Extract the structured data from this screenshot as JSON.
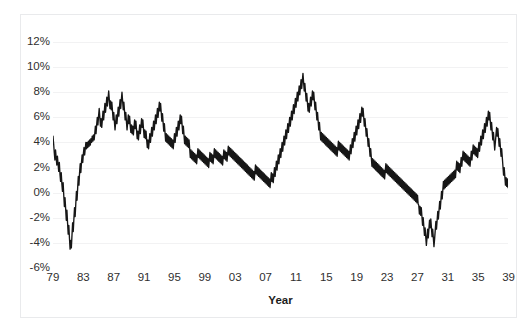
{
  "chart_data": {
    "type": "line",
    "title": "",
    "xlabel": "Year",
    "ylabel": "",
    "grid": true,
    "legend": false,
    "xlim": [
      1979,
      1948
    ],
    "ylim": [
      -6,
      12
    ],
    "ytick_labels": [
      "12%",
      "10%",
      "8%",
      "6%",
      "4%",
      "2%",
      "0%",
      "-2%",
      "-4%",
      "-6%"
    ],
    "ytick_values": [
      12,
      10,
      8,
      6,
      4,
      2,
      0,
      -2,
      -4,
      -6
    ],
    "xtick_labels": [
      "79",
      "83",
      "87",
      "91",
      "95",
      "99",
      "03",
      "07",
      "11",
      "15",
      "19",
      "23",
      "27",
      "31",
      "35",
      "39",
      "43",
      "47"
    ],
    "xtick_values": [
      1979,
      1983,
      1987,
      1991,
      1995,
      1999,
      2003,
      2007,
      2011,
      2015,
      2019,
      2023,
      2027,
      2031,
      2035,
      2039,
      2043,
      2047
    ],
    "series": [
      {
        "name": "rate",
        "color": "#161616",
        "x_start": 1979.0,
        "x_step": 0.0833333,
        "values": [
          4.5,
          3.9,
          3.2,
          2.6,
          3.4,
          2.8,
          2.2,
          2.9,
          2.3,
          1.7,
          2.4,
          1.5,
          0.9,
          1.6,
          0.7,
          0.1,
          0.8,
          -0.2,
          -1.1,
          -0.4,
          -1.3,
          -2.2,
          -1.4,
          -2.4,
          -3.3,
          -2.6,
          -3.6,
          -4.5,
          -3.8,
          -4.4,
          -3.4,
          -2.4,
          -3.1,
          -2.1,
          -1.2,
          -1.9,
          -0.9,
          0.1,
          -0.6,
          0.4,
          1.3,
          0.6,
          1.6,
          2.3,
          1.6,
          2.4,
          3.0,
          2.4,
          3.1,
          3.6,
          3.0,
          3.5,
          4.0,
          3.5,
          4.0,
          3.6,
          4.1,
          3.7,
          4.2,
          3.8,
          4.3,
          4.0,
          4.5,
          4.1,
          4.6,
          4.2,
          4.7,
          5.3,
          4.7,
          5.4,
          6.0,
          5.4,
          6.1,
          6.7,
          6.0,
          5.3,
          5.9,
          5.2,
          5.8,
          6.5,
          5.8,
          6.4,
          7.1,
          6.4,
          7.0,
          7.6,
          6.9,
          7.5,
          8.1,
          7.4,
          6.7,
          7.3,
          6.6,
          7.2,
          6.5,
          5.8,
          6.4,
          5.7,
          5.0,
          5.6,
          6.2,
          5.5,
          6.1,
          6.8,
          6.1,
          6.8,
          7.4,
          6.7,
          7.4,
          8.0,
          7.3,
          6.6,
          7.2,
          6.5,
          5.8,
          6.4,
          5.7,
          5.0,
          5.6,
          6.2,
          5.5,
          6.1,
          5.4,
          4.8,
          5.4,
          4.7,
          5.3,
          4.6,
          5.2,
          5.8,
          5.1,
          5.7,
          5.0,
          4.3,
          4.9,
          4.2,
          4.8,
          5.4,
          4.7,
          5.3,
          5.9,
          5.2,
          5.8,
          5.1,
          4.4,
          5.0,
          4.3,
          4.9,
          4.2,
          3.6,
          4.2,
          3.5,
          4.1,
          4.7,
          4.0,
          4.6,
          5.2,
          4.5,
          5.1,
          5.7,
          5.0,
          5.6,
          6.2,
          5.5,
          6.1,
          6.7,
          6.0,
          6.6,
          7.2,
          6.5,
          7.1,
          6.4,
          5.7,
          6.3,
          5.6,
          4.9,
          5.5,
          4.8,
          4.1,
          4.7,
          4.0,
          4.6,
          3.9,
          4.5,
          3.8,
          4.4,
          3.7,
          4.3,
          3.6,
          4.2,
          3.5,
          4.1,
          4.7,
          4.0,
          4.6,
          5.2,
          4.5,
          5.1,
          5.7,
          5.0,
          5.6,
          6.2,
          5.5,
          6.1,
          5.4,
          4.7,
          5.3,
          4.6,
          3.9,
          4.5,
          3.8,
          4.4,
          3.7,
          4.3,
          3.6,
          4.2,
          3.5,
          2.8,
          3.4,
          2.7,
          3.3,
          2.6,
          3.2,
          2.5,
          3.1,
          2.4,
          3.0,
          2.3,
          2.9,
          3.5,
          2.8,
          3.4,
          2.7,
          3.3,
          2.6,
          3.2,
          2.5,
          3.1,
          2.4,
          3.0,
          2.3,
          2.9,
          2.2,
          2.8,
          2.1,
          2.7,
          2.0,
          2.6,
          3.2,
          2.5,
          3.1,
          2.4,
          3.0,
          2.3,
          2.9,
          3.5,
          2.8,
          3.4,
          2.7,
          3.3,
          2.6,
          3.2,
          2.5,
          3.1,
          2.4,
          3.0,
          2.3,
          2.9,
          2.2,
          2.8,
          3.4,
          2.7,
          3.3,
          2.6,
          3.2,
          2.5,
          3.1,
          3.7,
          3.0,
          3.6,
          2.9,
          3.5,
          2.8,
          3.4,
          2.7,
          3.3,
          2.6,
          3.2,
          2.5,
          3.1,
          2.4,
          3.0,
          2.3,
          2.9,
          2.2,
          2.8,
          2.1,
          2.7,
          2.0,
          2.6,
          1.9,
          2.5,
          1.8,
          2.4,
          1.7,
          2.3,
          1.6,
          2.2,
          1.5,
          2.1,
          1.4,
          2.0,
          1.3,
          1.9,
          1.2,
          1.8,
          1.1,
          1.7,
          1.0,
          1.6,
          2.2,
          1.5,
          2.1,
          1.4,
          2.0,
          1.3,
          1.9,
          1.2,
          1.8,
          1.1,
          1.7,
          1.0,
          1.6,
          0.9,
          1.5,
          0.8,
          1.4,
          0.7,
          1.3,
          0.6,
          1.2,
          0.5,
          1.1,
          0.4,
          1.0,
          1.6,
          0.9,
          1.5,
          0.8,
          1.4,
          2.0,
          1.3,
          1.9,
          2.5,
          1.8,
          2.4,
          3.0,
          2.3,
          2.9,
          3.5,
          2.8,
          3.4,
          4.0,
          3.3,
          3.9,
          4.5,
          3.8,
          4.4,
          5.0,
          4.3,
          4.9,
          5.5,
          4.8,
          5.4,
          6.0,
          5.3,
          5.9,
          6.5,
          5.8,
          6.4,
          7.0,
          6.3,
          6.9,
          7.5,
          6.8,
          7.4,
          8.0,
          7.3,
          7.9,
          8.5,
          7.8,
          8.4,
          9.0,
          8.3,
          8.9,
          9.5,
          8.8,
          8.1,
          8.7,
          8.0,
          7.3,
          7.9,
          7.2,
          6.5,
          7.1,
          6.4,
          7.0,
          7.6,
          6.9,
          7.5,
          8.1,
          7.4,
          8.0,
          7.3,
          6.6,
          7.2,
          6.5,
          5.8,
          6.4,
          5.7,
          5.0,
          5.6,
          4.9,
          4.2,
          4.8,
          4.1,
          4.7,
          4.0,
          4.6,
          3.9,
          4.5,
          3.8,
          4.4,
          3.7,
          4.3,
          3.6,
          4.2,
          3.5,
          4.1,
          3.4,
          4.0,
          3.3,
          3.9,
          3.2,
          3.8,
          3.1,
          3.7,
          3.0,
          3.6,
          2.9,
          3.5,
          4.1,
          3.4,
          4.0,
          3.3,
          3.9,
          3.2,
          3.8,
          3.1,
          3.7,
          3.0,
          3.6,
          2.9,
          3.5,
          2.8,
          3.4,
          2.7,
          3.3,
          2.6,
          3.2,
          3.8,
          3.1,
          3.7,
          4.3,
          3.6,
          4.2,
          4.8,
          4.1,
          4.7,
          5.3,
          4.6,
          5.2,
          5.8,
          5.1,
          5.7,
          6.3,
          5.6,
          6.2,
          6.8,
          6.1,
          6.7,
          6.0,
          5.3,
          5.9,
          5.2,
          4.5,
          5.1,
          4.4,
          3.7,
          4.3,
          3.6,
          2.9,
          3.5,
          2.8,
          2.1,
          2.7,
          2.0,
          2.6,
          1.9,
          2.5,
          1.8,
          2.4,
          1.7,
          2.3,
          1.6,
          2.2,
          1.5,
          2.1,
          1.4,
          2.0,
          1.3,
          1.9,
          1.2,
          1.8,
          1.1,
          1.7,
          2.3,
          1.6,
          2.2,
          1.5,
          2.1,
          1.4,
          2.0,
          1.3,
          1.9,
          1.2,
          1.8,
          1.1,
          1.7,
          1.0,
          1.6,
          0.9,
          1.5,
          0.8,
          1.4,
          0.7,
          1.3,
          0.6,
          1.2,
          0.5,
          1.1,
          0.4,
          1.0,
          0.3,
          0.9,
          0.2,
          0.8,
          0.1,
          0.7,
          0.0,
          0.6,
          -0.1,
          0.5,
          -0.2,
          0.4,
          -0.3,
          0.3,
          -0.4,
          0.2,
          -0.5,
          0.1,
          -0.6,
          0.0,
          -0.7,
          -0.1,
          -0.8,
          -0.2,
          -0.9,
          -1.0,
          -1.7,
          -1.1,
          -1.8,
          -1.2,
          -1.9,
          -2.6,
          -2.0,
          -2.7,
          -3.4,
          -2.8,
          -3.5,
          -4.2,
          -3.6,
          -2.9,
          -3.6,
          -2.9,
          -2.2,
          -2.8,
          -2.1,
          -2.8,
          -3.5,
          -2.9,
          -3.6,
          -4.3,
          -3.7,
          -3.0,
          -2.3,
          -2.9,
          -2.2,
          -1.5,
          -2.1,
          -1.4,
          -0.7,
          -1.3,
          -0.6,
          0.1,
          -0.5,
          0.2,
          0.9,
          0.3,
          1.0,
          0.4,
          1.1,
          0.5,
          1.2,
          0.6,
          1.3,
          0.7,
          1.4,
          0.8,
          1.5,
          0.9,
          1.6,
          1.0,
          1.7,
          1.1,
          1.8,
          1.2,
          1.9,
          2.5,
          1.8,
          2.4,
          1.7,
          2.3,
          1.6,
          2.2,
          2.8,
          2.1,
          2.7,
          3.3,
          2.6,
          3.2,
          2.5,
          3.1,
          2.4,
          3.0,
          2.3,
          2.9,
          2.2,
          2.8,
          2.1,
          2.7,
          3.3,
          2.6,
          3.2,
          3.8,
          3.1,
          3.7,
          3.0,
          3.6,
          2.9,
          3.5,
          2.8,
          3.4,
          4.0,
          3.3,
          3.9,
          4.5,
          3.8,
          4.4,
          5.0,
          4.3,
          4.9,
          5.5,
          4.8,
          5.4,
          6.0,
          5.3,
          5.9,
          6.5,
          5.8,
          6.4,
          5.7,
          5.0,
          5.6,
          4.9,
          4.2,
          4.8,
          4.1,
          3.4,
          4.0,
          4.6,
          5.2,
          4.5,
          5.1,
          4.4,
          3.7,
          4.3,
          3.6,
          2.9,
          3.5,
          2.8,
          2.1,
          1.4,
          2.0,
          1.3,
          0.6,
          1.2,
          0.5,
          1.1,
          0.4
        ]
      }
    ]
  },
  "axis": {
    "x_title": "Year"
  }
}
